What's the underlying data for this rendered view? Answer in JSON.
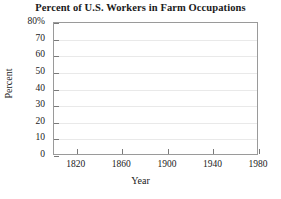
{
  "chart_data": {
    "type": "line",
    "title": "Percent of U.S. Workers in Farm Occupations",
    "xlabel": "Year",
    "ylabel": "Percent",
    "xlim": [
      1800,
      1980
    ],
    "ylim": [
      0,
      80
    ],
    "grid": true,
    "legend": "none",
    "series": [],
    "x": [],
    "values": [],
    "y_ticks": [
      {
        "value": 80,
        "label": "80%"
      },
      {
        "value": 70,
        "label": "70"
      },
      {
        "value": 60,
        "label": "60"
      },
      {
        "value": 50,
        "label": "50"
      },
      {
        "value": 40,
        "label": "40"
      },
      {
        "value": 30,
        "label": "30"
      },
      {
        "value": 20,
        "label": "20"
      },
      {
        "value": 10,
        "label": "10"
      },
      {
        "value": 0,
        "label": "0"
      }
    ],
    "x_ticks": [
      {
        "value": 1820,
        "label": "1820"
      },
      {
        "value": 1860,
        "label": "1860"
      },
      {
        "value": 1900,
        "label": "1900"
      },
      {
        "value": 1940,
        "label": "1940"
      },
      {
        "value": 1980,
        "label": "1980"
      }
    ],
    "note": "Empty plot grid; no data series drawn."
  },
  "colors": {
    "axis": "#9a9a9a",
    "tick": "#7a7a7a",
    "grid": "#e9e9e9",
    "text": "#1a1a1a",
    "background": "#ffffff"
  }
}
